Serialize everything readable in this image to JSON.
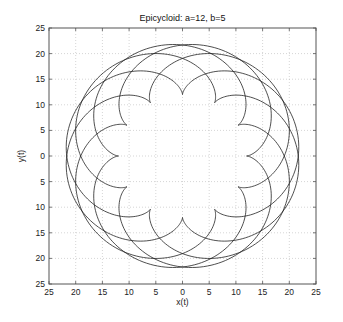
{
  "chart_data": {
    "type": "line",
    "title": "Epicycloid: a=12, b=5",
    "xlabel": "x(t)",
    "ylabel": "y(t)",
    "xlim": [
      -25,
      25
    ],
    "ylim": [
      -25,
      25
    ],
    "grid": true,
    "legend": null,
    "x_tick_values": [
      -25,
      -20,
      -15,
      -10,
      -5,
      0,
      5,
      10,
      15,
      20,
      25
    ],
    "x_tick_labels": [
      "25",
      "20",
      "15",
      "10",
      "5",
      "0",
      "5",
      "10",
      "15",
      "20",
      "25"
    ],
    "y_tick_values": [
      25,
      20,
      15,
      10,
      5,
      0,
      -5,
      -10,
      -15,
      -20,
      -25
    ],
    "y_tick_labels": [
      "25",
      "20",
      "15",
      "10",
      "5",
      "0",
      "5",
      "10",
      "15",
      "20",
      "25"
    ],
    "series": [
      {
        "name": "epicycloid",
        "equation": "x = (a+b)cos(t) - b cos((a+b)t/b), y = (a+b)sin(t) - b sin((a+b)t/b)",
        "params": {
          "a": 12,
          "b": 5
        },
        "t_range": [
          0,
          31.4159
        ],
        "samples": 1500,
        "color": "#222222",
        "max_radius": 22,
        "min_radius": 12,
        "cusps": 12
      }
    ]
  },
  "style": {
    "line_color": "#222222",
    "grid_color": "#b8b8b8",
    "axis_color": "#555555"
  }
}
